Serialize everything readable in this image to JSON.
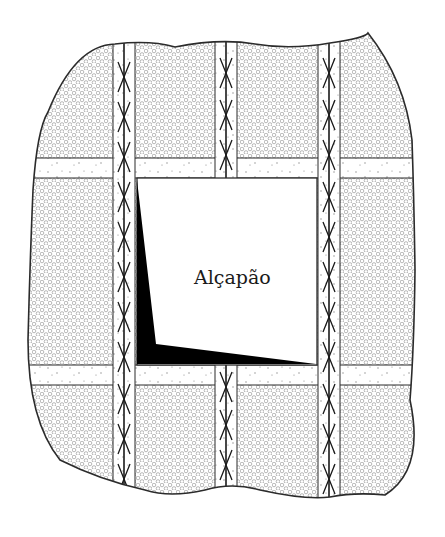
{
  "diagram": {
    "trapdoor_label": "Alçapão",
    "colors": {
      "outline": "#2b2b2b",
      "hatch": "#9a9a9a",
      "background": "#ffffff",
      "shadow": "#000000"
    },
    "parts": [
      "gravel-fill",
      "joists-with-cross-bracing",
      "blocking-strips",
      "trapdoor-opening",
      "trapdoor-shadow"
    ]
  }
}
